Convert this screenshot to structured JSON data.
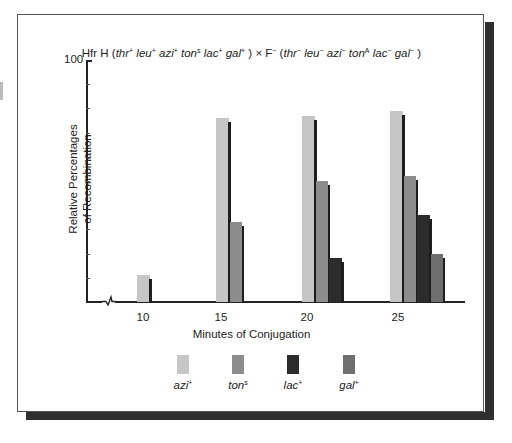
{
  "chart_data": {
    "type": "bar",
    "title_parts": {
      "prefix": "Hfr H (",
      "donor": [
        {
          "gene": "thr",
          "sup": "+"
        },
        {
          "gene": "leu",
          "sup": "+"
        },
        {
          "gene": "azi",
          "sup": "+"
        },
        {
          "gene": "ton",
          "sup": "s"
        },
        {
          "gene": "lac",
          "sup": "+"
        },
        {
          "gene": "gal",
          "sup": "+"
        }
      ],
      "cross": ") × F",
      "cross_sup": "−",
      "recipient": [
        {
          "gene": "thr",
          "sup": "−"
        },
        {
          "gene": "leu",
          "sup": "−"
        },
        {
          "gene": "azi",
          "sup": "−"
        },
        {
          "gene": "ton",
          "sup": "A"
        },
        {
          "gene": "lac",
          "sup": "−"
        },
        {
          "gene": "gal",
          "sup": "−"
        }
      ],
      "suffix": ")"
    },
    "xlabel": "Minutes of Conjugation",
    "ylabel_line1": "Relative Percentages",
    "ylabel_line2": "of Recombination",
    "y_top_label": "100",
    "ylim": [
      0,
      100
    ],
    "y_ticks": [
      10,
      20,
      30,
      40,
      50,
      60,
      70,
      80,
      90,
      100
    ],
    "grid": false,
    "axis_break": true,
    "legend_position": "bottom",
    "categories": [
      "10",
      "15",
      "20",
      "25"
    ],
    "series": [
      {
        "name": "azi",
        "sup": "+",
        "color": "#c6c6c6",
        "values": [
          11,
          76,
          77,
          79
        ]
      },
      {
        "name": "ton",
        "sup": "s",
        "color": "#8c8c8c",
        "values": [
          null,
          33,
          50,
          52
        ]
      },
      {
        "name": "lac",
        "sup": "+",
        "color": "#2c2c2c",
        "values": [
          null,
          null,
          18,
          36
        ]
      },
      {
        "name": "gal",
        "sup": "+",
        "color": "#6e6e6e",
        "values": [
          null,
          null,
          null,
          20
        ]
      }
    ]
  }
}
